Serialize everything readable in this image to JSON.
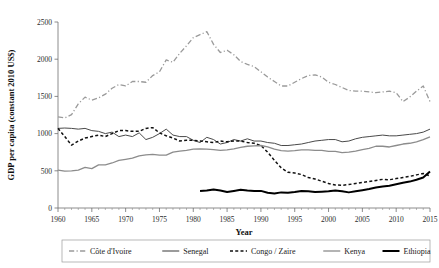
{
  "chart_data": {
    "type": "line",
    "title": "",
    "xlabel": "Year",
    "ylabel": "GDP per capita (constant 2010 US$)",
    "xlim": [
      1960,
      2015
    ],
    "ylim": [
      0,
      2500
    ],
    "grid": false,
    "legend_position": "bottom",
    "xticks": [
      1960,
      1965,
      1970,
      1975,
      1980,
      1985,
      1990,
      1995,
      2000,
      2005,
      2010,
      2015
    ],
    "xtick_labels": [
      "1960",
      "1965",
      "1970",
      "1975",
      "1980",
      "1985",
      "1990",
      "1995",
      "2000",
      "2005",
      "2010",
      "2015"
    ],
    "yticks": [
      0,
      500,
      1000,
      1500,
      2000,
      2500
    ],
    "ytick_labels": [
      "0",
      "500",
      "1000",
      "1500",
      "2000",
      "2500"
    ],
    "series": [
      {
        "name": "Côte d'Ivoire",
        "style": "dashdot",
        "color": "#9a9a9a",
        "width": 1.3,
        "x": [
          1960,
          1961,
          1962,
          1963,
          1964,
          1965,
          1966,
          1967,
          1968,
          1969,
          1970,
          1971,
          1972,
          1973,
          1974,
          1975,
          1976,
          1977,
          1978,
          1979,
          1980,
          1981,
          1982,
          1983,
          1984,
          1985,
          1986,
          1987,
          1988,
          1989,
          1990,
          1991,
          1992,
          1993,
          1994,
          1995,
          1996,
          1997,
          1998,
          1999,
          2000,
          2001,
          2002,
          2003,
          2004,
          2005,
          2006,
          2007,
          2008,
          2009,
          2010,
          2011,
          2012,
          2013,
          2014,
          2015
        ],
        "y": [
          1225,
          1210,
          1255,
          1400,
          1490,
          1450,
          1480,
          1530,
          1610,
          1660,
          1640,
          1700,
          1700,
          1690,
          1780,
          1830,
          1990,
          1960,
          2080,
          2180,
          2290,
          2330,
          2370,
          2200,
          2090,
          2120,
          2060,
          1970,
          1930,
          1900,
          1830,
          1760,
          1700,
          1640,
          1640,
          1690,
          1740,
          1780,
          1790,
          1760,
          1690,
          1660,
          1620,
          1580,
          1570,
          1570,
          1560,
          1550,
          1560,
          1570,
          1550,
          1430,
          1490,
          1570,
          1640,
          1430
        ]
      },
      {
        "name": "Senegal",
        "style": "solid",
        "color": "#4a4a4a",
        "width": 1.0,
        "x": [
          1960,
          1961,
          1962,
          1963,
          1964,
          1965,
          1966,
          1967,
          1968,
          1969,
          1970,
          1971,
          1972,
          1973,
          1974,
          1975,
          1976,
          1977,
          1978,
          1979,
          1980,
          1981,
          1982,
          1983,
          1984,
          1985,
          1986,
          1987,
          1988,
          1989,
          1990,
          1991,
          1992,
          1993,
          1994,
          1995,
          1996,
          1997,
          1998,
          1999,
          2000,
          2001,
          2002,
          2003,
          2004,
          2005,
          2006,
          2007,
          2008,
          2009,
          2010,
          2011,
          2012,
          2013,
          2014,
          2015
        ],
        "y": [
          1070,
          1075,
          1070,
          1060,
          1070,
          1040,
          1030,
          1000,
          1020,
          960,
          980,
          960,
          1010,
          920,
          950,
          1000,
          1060,
          980,
          960,
          960,
          910,
          880,
          950,
          920,
          860,
          880,
          920,
          900,
          930,
          900,
          900,
          880,
          870,
          840,
          840,
          850,
          860,
          880,
          900,
          910,
          920,
          920,
          890,
          900,
          930,
          950,
          960,
          970,
          980,
          970,
          970,
          980,
          990,
          1000,
          1020,
          1060
        ]
      },
      {
        "name": "Congo / Zaire",
        "style": "dashed",
        "color": "#111111",
        "width": 1.5,
        "x": [
          1960,
          1961,
          1962,
          1963,
          1964,
          1965,
          1966,
          1967,
          1968,
          1969,
          1970,
          1971,
          1972,
          1973,
          1974,
          1975,
          1976,
          1977,
          1978,
          1979,
          1980,
          1981,
          1982,
          1983,
          1984,
          1985,
          1986,
          1987,
          1988,
          1989,
          1990,
          1991,
          1992,
          1993,
          1994,
          1995,
          1996,
          1997,
          1998,
          1999,
          2000,
          2001,
          2002,
          2003,
          2004,
          2005,
          2006,
          2007,
          2008,
          2009,
          2010,
          2011,
          2012,
          2013,
          2014,
          2015
        ],
        "y": [
          1070,
          960,
          845,
          900,
          940,
          960,
          980,
          960,
          1000,
          1040,
          1040,
          1030,
          1030,
          1070,
          1080,
          1010,
          970,
          940,
          900,
          910,
          910,
          900,
          890,
          880,
          900,
          890,
          900,
          900,
          880,
          870,
          840,
          750,
          640,
          540,
          480,
          470,
          450,
          410,
          390,
          360,
          330,
          310,
          305,
          315,
          330,
          345,
          355,
          370,
          385,
          380,
          395,
          410,
          425,
          445,
          465,
          430
        ]
      },
      {
        "name": "Kenya",
        "style": "solid",
        "color": "#8c8c8c",
        "width": 1.3,
        "x": [
          1960,
          1961,
          1962,
          1963,
          1964,
          1965,
          1966,
          1967,
          1968,
          1969,
          1970,
          1971,
          1972,
          1973,
          1974,
          1975,
          1976,
          1977,
          1978,
          1979,
          1980,
          1981,
          1982,
          1983,
          1984,
          1985,
          1986,
          1987,
          1988,
          1989,
          1990,
          1991,
          1992,
          1993,
          1994,
          1995,
          1996,
          1997,
          1998,
          1999,
          2000,
          2001,
          2002,
          2003,
          2004,
          2005,
          2006,
          2007,
          2008,
          2009,
          2010,
          2011,
          2012,
          2013,
          2014,
          2015
        ],
        "y": [
          510,
          495,
          500,
          510,
          545,
          530,
          580,
          580,
          605,
          640,
          655,
          670,
          700,
          715,
          720,
          710,
          710,
          750,
          765,
          775,
          790,
          795,
          790,
          785,
          775,
          780,
          795,
          815,
          830,
          835,
          840,
          820,
          790,
          770,
          765,
          770,
          780,
          780,
          775,
          775,
          760,
          760,
          745,
          750,
          765,
          785,
          800,
          830,
          830,
          820,
          840,
          860,
          870,
          890,
          920,
          955
        ]
      },
      {
        "name": "Ethiopia",
        "style": "solid",
        "color": "#000000",
        "width": 2.0,
        "x": [
          1981,
          1982,
          1983,
          1984,
          1985,
          1986,
          1987,
          1988,
          1989,
          1990,
          1991,
          1992,
          1993,
          1994,
          1995,
          1996,
          1997,
          1998,
          1999,
          2000,
          2001,
          2002,
          2003,
          2004,
          2005,
          2006,
          2007,
          2008,
          2009,
          2010,
          2011,
          2012,
          2013,
          2014,
          2015
        ],
        "y": [
          230,
          235,
          250,
          235,
          215,
          230,
          245,
          235,
          230,
          230,
          205,
          195,
          210,
          205,
          215,
          230,
          225,
          215,
          220,
          225,
          235,
          225,
          210,
          225,
          240,
          255,
          275,
          290,
          300,
          320,
          340,
          355,
          380,
          410,
          490
        ]
      }
    ]
  },
  "legend": {
    "items": [
      {
        "label": "Côte d'Ivoire"
      },
      {
        "label": "Senegal"
      },
      {
        "label": "Congo / Zaire"
      },
      {
        "label": "Kenya"
      },
      {
        "label": "Ethiopia"
      }
    ]
  }
}
